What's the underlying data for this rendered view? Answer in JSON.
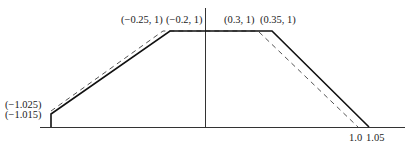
{
  "diagram": {
    "type": "trapezoidal membership functions",
    "colors": {
      "background": "#ffffff",
      "axis": "#333333",
      "solid": "#111111",
      "dashed": "#555555",
      "text": "#222222"
    },
    "labels": {
      "top_left_dashed": "(−0.25, 1)",
      "top_left_solid": "(−0.2, 1)",
      "top_right_dashed": "(0.3, 1)",
      "top_right_solid": "(0.35, 1)",
      "left_dashed_start": "(−1.025)",
      "left_solid_start": "(−1.015)",
      "right_dashed_end": "1.0",
      "right_solid_end": "1.05"
    },
    "series": [
      {
        "name": "solid",
        "style": "solid",
        "points": [
          [
            -1.015,
            0.15
          ],
          [
            -0.2,
            1
          ],
          [
            0.35,
            1
          ],
          [
            1.05,
            0
          ]
        ]
      },
      {
        "name": "dashed",
        "style": "dashed",
        "points": [
          [
            -1.025,
            0.18
          ],
          [
            -0.25,
            1
          ],
          [
            0.3,
            1
          ],
          [
            1.0,
            0
          ]
        ]
      }
    ]
  }
}
